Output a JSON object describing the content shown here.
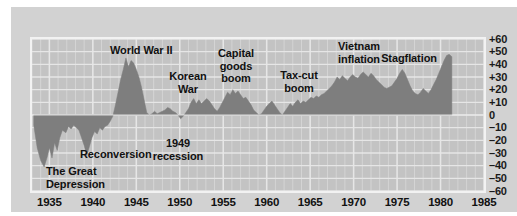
{
  "chart_data": {
    "type": "area",
    "title": "",
    "subtitle": "",
    "xlabel": "",
    "ylabel": "",
    "xlim": [
      1933,
      1985
    ],
    "ylim": [
      -60,
      60
    ],
    "grid": true,
    "legend": "none",
    "baseline": 0,
    "series_name": "Annual percent change",
    "xticks": [
      "1935",
      "1940",
      "1945",
      "1950",
      "1955",
      "1960",
      "1965",
      "1970",
      "1975",
      "1980",
      "1985"
    ],
    "xtick_values": [
      1935,
      1940,
      1945,
      1950,
      1955,
      1960,
      1965,
      1970,
      1975,
      1980,
      1985
    ],
    "yticks": [
      "+60",
      "+50",
      "+40",
      "+30",
      "+20",
      "+10",
      "0",
      "–10",
      "–20",
      "–30",
      "–40",
      "–50",
      "–60"
    ],
    "ytick_values": [
      60,
      50,
      40,
      30,
      20,
      10,
      0,
      -10,
      -20,
      -30,
      -40,
      -50,
      -60
    ],
    "x": [
      1933.2,
      1933.6,
      1934.0,
      1934.4,
      1934.8,
      1935.0,
      1935.3,
      1935.6,
      1935.9,
      1936.2,
      1936.5,
      1936.9,
      1937.2,
      1937.5,
      1937.8,
      1938.1,
      1938.4,
      1938.7,
      1939.0,
      1939.3,
      1939.6,
      1939.9,
      1940.2,
      1940.5,
      1940.8,
      1941.1,
      1941.4,
      1941.7,
      1942.0,
      1942.3,
      1942.6,
      1942.9,
      1943.2,
      1943.5,
      1943.8,
      1944.1,
      1944.4,
      1944.7,
      1945.0,
      1945.3,
      1945.6,
      1945.9,
      1946.2,
      1946.5,
      1946.8,
      1947.1,
      1947.4,
      1947.7,
      1948.0,
      1948.3,
      1948.6,
      1948.9,
      1949.2,
      1949.5,
      1949.8,
      1950.1,
      1950.4,
      1950.7,
      1951.0,
      1951.3,
      1951.6,
      1951.9,
      1952.2,
      1952.5,
      1952.8,
      1953.1,
      1953.4,
      1953.7,
      1954.0,
      1954.3,
      1954.6,
      1954.9,
      1955.2,
      1955.5,
      1955.8,
      1956.1,
      1956.4,
      1956.7,
      1957.0,
      1957.3,
      1957.6,
      1957.9,
      1958.2,
      1958.5,
      1958.8,
      1959.1,
      1959.4,
      1959.7,
      1960.0,
      1960.3,
      1960.6,
      1960.9,
      1961.2,
      1961.5,
      1961.8,
      1962.1,
      1962.4,
      1962.7,
      1963.0,
      1963.3,
      1963.6,
      1963.9,
      1964.2,
      1964.5,
      1964.8,
      1965.1,
      1965.4,
      1965.7,
      1966.0,
      1966.3,
      1966.6,
      1966.9,
      1967.2,
      1967.5,
      1967.8,
      1968.1,
      1968.4,
      1968.7,
      1969.0,
      1969.3,
      1969.6,
      1969.9,
      1970.2,
      1970.5,
      1970.8,
      1971.1,
      1971.4,
      1971.7,
      1972.0,
      1972.3,
      1972.6,
      1972.9,
      1973.2,
      1973.5,
      1973.8,
      1974.1,
      1974.4,
      1974.7,
      1975.0,
      1975.3,
      1975.6,
      1975.9,
      1976.2,
      1976.5,
      1976.8,
      1977.1,
      1977.4,
      1977.7,
      1978.0,
      1978.3,
      1978.6,
      1978.9,
      1979.2,
      1979.5,
      1979.8,
      1980.1,
      1980.4,
      1980.7,
      1981.0,
      1981.3
    ],
    "y": [
      -8,
      -26,
      -36,
      -41,
      -32,
      -26,
      -34,
      -22,
      -28,
      -18,
      -12,
      -14,
      -9,
      -11,
      -8,
      -10,
      -12,
      -18,
      -24,
      -32,
      -25,
      -18,
      -13,
      -15,
      -10,
      -12,
      -9,
      -8,
      -5,
      -1,
      8,
      18,
      28,
      36,
      45,
      38,
      43,
      41,
      36,
      30,
      22,
      12,
      2,
      0,
      1,
      3,
      1,
      2,
      3,
      4,
      6,
      5,
      3,
      2,
      0,
      -3,
      -1,
      2,
      5,
      10,
      13,
      9,
      12,
      9,
      11,
      13,
      11,
      8,
      5,
      3,
      6,
      10,
      14,
      18,
      16,
      20,
      17,
      19,
      16,
      13,
      14,
      11,
      8,
      4,
      2,
      0,
      1,
      4,
      7,
      9,
      11,
      8,
      5,
      2,
      0,
      3,
      6,
      9,
      7,
      10,
      12,
      9,
      11,
      10,
      12,
      14,
      13,
      15,
      14,
      16,
      17,
      19,
      21,
      23,
      26,
      30,
      28,
      31,
      29,
      27,
      30,
      32,
      30,
      29,
      32,
      34,
      32,
      30,
      33,
      31,
      28,
      26,
      24,
      22,
      21,
      22,
      23,
      26,
      29,
      33,
      36,
      33,
      28,
      23,
      19,
      17,
      16,
      18,
      21,
      19,
      17,
      20,
      24,
      28,
      33,
      38,
      43,
      47,
      48,
      46,
      44,
      42,
      39,
      35,
      30,
      26,
      22,
      18
    ],
    "annotations": [
      {
        "id": "world-war-ii",
        "text": "World War II",
        "x": 99,
        "y": 37,
        "align": "left"
      },
      {
        "id": "korean-war",
        "text": "Korean\nWar",
        "x": 177,
        "y": 63,
        "align": "center"
      },
      {
        "id": "capital-goods-boom",
        "text": "Capital\ngoods\nboom",
        "x": 225,
        "y": 40,
        "align": "center"
      },
      {
        "id": "tax-cut-boom",
        "text": "Tax-cut\nboom",
        "x": 288,
        "y": 62,
        "align": "center"
      },
      {
        "id": "vietnam-inflation",
        "text": "Vietnam\ninflation",
        "x": 348,
        "y": 33,
        "align": "center"
      },
      {
        "id": "stagflation",
        "text": "Stagflation",
        "x": 398,
        "y": 45,
        "align": "center"
      },
      {
        "id": "reconversion",
        "text": "Reconversion",
        "x": 69,
        "y": 141,
        "align": "left"
      },
      {
        "id": "nineteen-forty-nine-recession",
        "text": "1949\nrecession",
        "x": 167,
        "y": 130,
        "align": "center"
      },
      {
        "id": "the-great-depression",
        "text": "The Great\nDepression",
        "x": 35,
        "y": 158,
        "align": "left"
      }
    ]
  },
  "style": {
    "page_background": "#ffffff",
    "card_background": "#d2d2d2",
    "plot_background": "#c3c3c3",
    "grid_color": "#e8e8e8",
    "area_fill": "#7e7e7e",
    "axis_border": "#f2f2f2",
    "text_color": "#111111"
  }
}
